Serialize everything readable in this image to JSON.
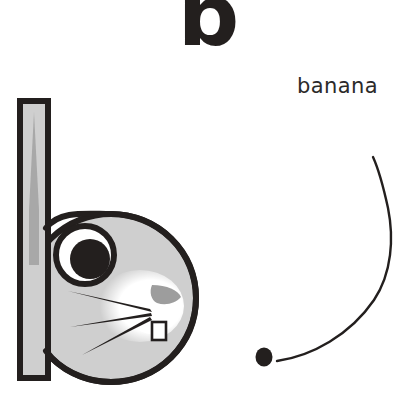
{
  "page": {
    "kind": "alphabet-worksheet",
    "background_color": "#ffffff",
    "width": 417,
    "height": 402
  },
  "heading": {
    "letter": "b"
  },
  "word": {
    "text": "banana"
  },
  "illustration": {
    "name": "rabbit-letter-b",
    "description": "A rabbit whose head and single upright ear form the shape of a lowercase letter b",
    "colors": {
      "outline": "#231f1e",
      "body_fill": "#cfcfcf",
      "ear_inner": "#a8a8a8",
      "muzzle": "#ffffff",
      "nose": "#9d9d9d",
      "eye_white": "#ffffff",
      "pupil": "#231f1e",
      "tooth": "#ffffff"
    },
    "parts": [
      "ear-stem",
      "head-circle",
      "eye",
      "pupil",
      "muzzle",
      "whisker-upper",
      "whisker-middle",
      "whisker-lower",
      "nose",
      "tooth"
    ]
  },
  "stroke_guide": {
    "name": "letter-b-stroke-guide",
    "description": "Handwriting stroke guide: a starting dot and a single curved stroke forming the bowl of the letter b",
    "stroke_color": "#231f1e",
    "dot": {
      "cx": 264,
      "cy": 357,
      "rx": 8,
      "ry": 9
    },
    "curve_start": {
      "x": 277,
      "y": 360
    },
    "curve_end": {
      "x": 373,
      "y": 157
    },
    "curve_stroke_width": 2.2
  }
}
